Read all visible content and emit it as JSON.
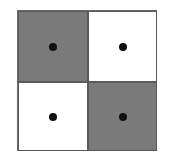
{
  "diagram": {
    "type": "2x2 checkerboard grid with center dots",
    "colors": {
      "shaded": "#7a7a7a",
      "unshaded": "#ffffff",
      "dot": "#111111"
    },
    "cells": [
      {
        "row": 0,
        "col": 0,
        "fill": "shaded",
        "dot": true
      },
      {
        "row": 0,
        "col": 1,
        "fill": "unshaded",
        "dot": true
      },
      {
        "row": 1,
        "col": 0,
        "fill": "unshaded",
        "dot": true
      },
      {
        "row": 1,
        "col": 1,
        "fill": "shaded",
        "dot": true
      }
    ]
  }
}
